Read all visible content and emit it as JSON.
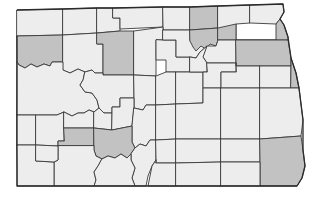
{
  "figure": {
    "kind": "choropleth-map",
    "title": "",
    "caption": "",
    "background_color": "#ffffff"
  },
  "legend": {
    "shown": false,
    "shaded_color": "#c2c2c2",
    "shaded_label": "Highlighted county",
    "plain_color": "#ededed",
    "plain_label": "Other county",
    "border_color": "#3a3a3a"
  },
  "map": {
    "viewbox": "0 0 329 197",
    "outline_color": "#2b2b2b",
    "counties": [
      {
        "id": "divide",
        "name": "Divide",
        "shaded": false,
        "points": "17,10 63,9 63,35 17,36"
      },
      {
        "id": "burke",
        "name": "Burke",
        "shaded": false,
        "points": "63,9 97,8 97,33 63,35"
      },
      {
        "id": "renville",
        "name": "Renville",
        "shaded": false,
        "points": "97,8 113,8 113,18 120,18 120,31 97,33"
      },
      {
        "id": "bottineau",
        "name": "Bottineau",
        "shaded": false,
        "points": "113,8 163,7 163,27 120,29 120,18 113,18"
      },
      {
        "id": "rolette",
        "name": "Rolette",
        "shaded": false,
        "points": "163,7 190,7 190,30 163,30 163,27"
      },
      {
        "id": "towner",
        "name": "Towner",
        "shaded": true,
        "points": "190,7 218,6 218,28 190,30"
      },
      {
        "id": "cavalier",
        "name": "Cavalier",
        "shaded": false,
        "points": "218,6 250,5 250,23 236,24 236,40 218,40"
      },
      {
        "id": "pembina",
        "name": "Pembina",
        "shaded": false,
        "points": "250,5 283,4 284,12 280,19 276,24 250,23"
      },
      {
        "id": "williams",
        "name": "Williams",
        "shaded": true,
        "points": "17,36 63,35 63,62 52,62 50,66 44,64 37,67 31,64 25,68 19,65 17,62"
      },
      {
        "id": "mountrail",
        "name": "Mountrail",
        "shaded": false,
        "points": "63,35 97,33 97,44 103,44 103,73 95,73 92,70 85,72 78,69 70,73 63,70"
      },
      {
        "id": "ward",
        "name": "Ward",
        "shaded": true,
        "points": "97,33 120,31 134,31 134,75 103,75 103,44 97,44"
      },
      {
        "id": "mchenry",
        "name": "McHenry",
        "shaded": false,
        "points": "134,31 163,27 163,40 156,40 156,76 134,75"
      },
      {
        "id": "pierce",
        "name": "Pierce",
        "shaded": false,
        "points": "163,40 176,40 176,57 190,57 190,72 166,72 166,60 156,60 156,40"
      },
      {
        "id": "benson",
        "name": "Benson",
        "shaded": false,
        "points": "163,30 190,30 190,41 205,41 207,46 200,52 196,58 190,57 176,57 176,40 163,40"
      },
      {
        "id": "ramsey",
        "name": "Ramsey",
        "shaded": true,
        "points": "190,30 218,28 218,40 216,46 210,44 206,49 201,46 196,51 193,47 190,41"
      },
      {
        "id": "walsh",
        "name": "Walsh",
        "shaded": true,
        "points": "218,28 236,24 236,40 276,40 276,24 280,19 284,25 288,37 288,40 236,40 218,40"
      },
      {
        "id": "nelson",
        "name": "Nelson",
        "shaded": false,
        "points": "207,46 216,46 218,40 236,40 236,63 207,63 203,57"
      },
      {
        "id": "grand-forks",
        "name": "Grand Forks",
        "shaded": true,
        "points": "236,40 288,40 291,58 291,66 236,66 236,63"
      },
      {
        "id": "mckenzie",
        "name": "McKenzie",
        "shaded": false,
        "points": "17,62 19,65 25,68 31,64 37,67 44,64 50,66 52,62 63,62 63,70 70,73 78,69 85,72 83,80 80,85 85,92 92,93 97,100 99,108 94,112 89,110 84,113 78,113 72,116 64,112 57,115 17,115"
      },
      {
        "id": "dunn",
        "name": "Dunn",
        "shaded": false,
        "points": "85,72 92,70 95,73 103,73 103,75 134,75 134,98 120,98 120,107 112,107 112,113 104,113 99,108 97,100 92,93 85,92 80,85 83,80"
      },
      {
        "id": "mclean",
        "name": "McLean",
        "shaded": false,
        "points": "134,75 156,76 156,105 146,105 143,110 134,108 134,98"
      },
      {
        "id": "sheridan",
        "name": "Sheridan",
        "shaded": false,
        "points": "156,76 166,72 176,72 176,104 156,105"
      },
      {
        "id": "wells",
        "name": "Wells",
        "shaded": false,
        "points": "176,72 190,72 203,72 203,103 176,104"
      },
      {
        "id": "eddy",
        "name": "Eddy",
        "shaded": false,
        "points": "190,57 196,58 200,52 207,46 203,57 207,63 207,72 190,72"
      },
      {
        "id": "foster",
        "name": "Foster",
        "shaded": false,
        "points": "207,63 236,63 236,72 221,72 221,88 203,88 203,72 207,72"
      },
      {
        "id": "griggs",
        "name": "Griggs",
        "shaded": false,
        "points": "236,63 236,66 260,66 260,88 221,88 221,72 236,72"
      },
      {
        "id": "steele",
        "name": "Steele",
        "shaded": false,
        "points": "260,66 291,66 291,88 260,88"
      },
      {
        "id": "traill",
        "name": "Traill",
        "shaded": true,
        "points": "291,66 291,58 296,73 299,88 291,88"
      },
      {
        "id": "golden-valley",
        "name": "Golden Valley",
        "shaded": false,
        "points": "17,115 36,115 36,145 17,145"
      },
      {
        "id": "billings",
        "name": "Billings",
        "shaded": false,
        "points": "36,115 57,115 64,112 64,141 58,141 58,146 36,145"
      },
      {
        "id": "stark",
        "name": "Stark",
        "shaded": false,
        "points": "64,112 72,116 78,113 84,113 89,110 94,112 94,128 64,128"
      },
      {
        "id": "mercer-oliver",
        "name": "Mercer",
        "shaded": false,
        "points": "94,112 99,108 104,113 112,113 112,130 94,128"
      },
      {
        "id": "oliver",
        "name": "Oliver",
        "shaded": false,
        "points": "112,113 112,107 120,107 120,98 134,98 134,108 132,126 112,130"
      },
      {
        "id": "burleigh",
        "name": "Burleigh",
        "shaded": false,
        "points": "134,108 143,110 146,105 156,105 156,140 150,140 146,146 140,144 135,148 132,142 132,126"
      },
      {
        "id": "kidder",
        "name": "Kidder",
        "shaded": false,
        "points": "156,105 176,104 176,139 156,140"
      },
      {
        "id": "stutsman",
        "name": "Stutsman",
        "shaded": false,
        "points": "176,104 203,103 203,88 221,88 221,139 176,139"
      },
      {
        "id": "barnes",
        "name": "Barnes",
        "shaded": false,
        "points": "221,88 260,88 260,139 221,139"
      },
      {
        "id": "cass",
        "name": "Cass",
        "shaded": false,
        "points": "260,88 291,88 299,88 301,104 303,120 301,136 260,139"
      },
      {
        "id": "dunn-s",
        "name": "Hettinger",
        "shaded": true,
        "points": "64,128 94,128 94,146 58,146 58,141 64,141"
      },
      {
        "id": "morton",
        "name": "Morton",
        "shaded": true,
        "points": "94,128 112,130 132,126 132,142 135,148 131,154 127,158 121,154 115,158 108,156 102,159 96,156 94,150"
      },
      {
        "id": "grant",
        "name": "Grant",
        "shaded": false,
        "points": "94,146 94,150 96,156 102,159 98,166 94,172 96,180 94,186 54,186 54,162 58,160 58,146"
      },
      {
        "id": "bowman",
        "name": "Bowman",
        "shaded": false,
        "points": "17,145 36,145 36,161 54,162 54,186 17,186 17,170"
      },
      {
        "id": "slope",
        "name": "Slope",
        "shaded": false,
        "points": "36,145 58,146 58,160 54,162 36,161"
      },
      {
        "id": "emmons",
        "name": "Emmons",
        "shaded": false,
        "points": "135,148 140,144 146,146 150,140 156,140 156,160 152,166 148,176 146,186 135,186 132,178 135,168 131,160 131,154"
      },
      {
        "id": "sioux",
        "name": "Sioux",
        "shaded": false,
        "points": "102,159 108,156 115,158 121,154 127,158 131,154 131,160 135,168 132,178 135,186 96,186 94,186 96,180 94,172 98,166"
      },
      {
        "id": "logan",
        "name": "Logan",
        "shaded": false,
        "points": "156,140 176,139 176,163 156,163 156,160"
      },
      {
        "id": "lamoure",
        "name": "LaMoure",
        "shaded": false,
        "points": "176,139 221,139 221,162 176,163"
      },
      {
        "id": "ransom",
        "name": "Ransom",
        "shaded": false,
        "points": "221,139 260,139 260,162 221,162"
      },
      {
        "id": "richland",
        "name": "Richland",
        "shaded": true,
        "points": "260,139 301,136 303,150 305,166 302,178 297,186 260,186 260,162"
      },
      {
        "id": "mcintosh",
        "name": "McIntosh",
        "shaded": false,
        "points": "156,163 176,163 176,186 148,186 152,166 156,160"
      },
      {
        "id": "dickey",
        "name": "Dickey",
        "shaded": false,
        "points": "176,163 221,162 221,186 176,186"
      },
      {
        "id": "sargent",
        "name": "Sargent",
        "shaded": false,
        "points": "221,162 260,162 260,186 221,186"
      }
    ],
    "state_border": "17,10 63,9 97,8 113,8 163,7 190,7 218,6 250,5 283,4 284,12 280,19 284,25 288,37 291,58 296,73 299,88 301,104 303,120 303,150 305,166 302,178 297,186 260,186 221,186 176,186 148,186 135,186 96,186 54,186 17,186 17,145 17,115 17,62 17,36"
  }
}
